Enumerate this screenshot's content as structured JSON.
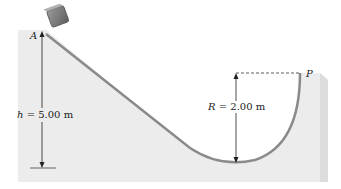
{
  "figure": {
    "type": "physics-diagram"
  },
  "points": {
    "start": "A",
    "end": "P"
  },
  "height": {
    "symbol": "h",
    "equals": "=",
    "value": "5.00 m"
  },
  "radius": {
    "symbol": "R",
    "equals": "=",
    "value": "2.00 m"
  },
  "colors": {
    "slab": "#ececec",
    "track": "#8a8a8a",
    "block": "#777777",
    "annotation": "#222222"
  }
}
